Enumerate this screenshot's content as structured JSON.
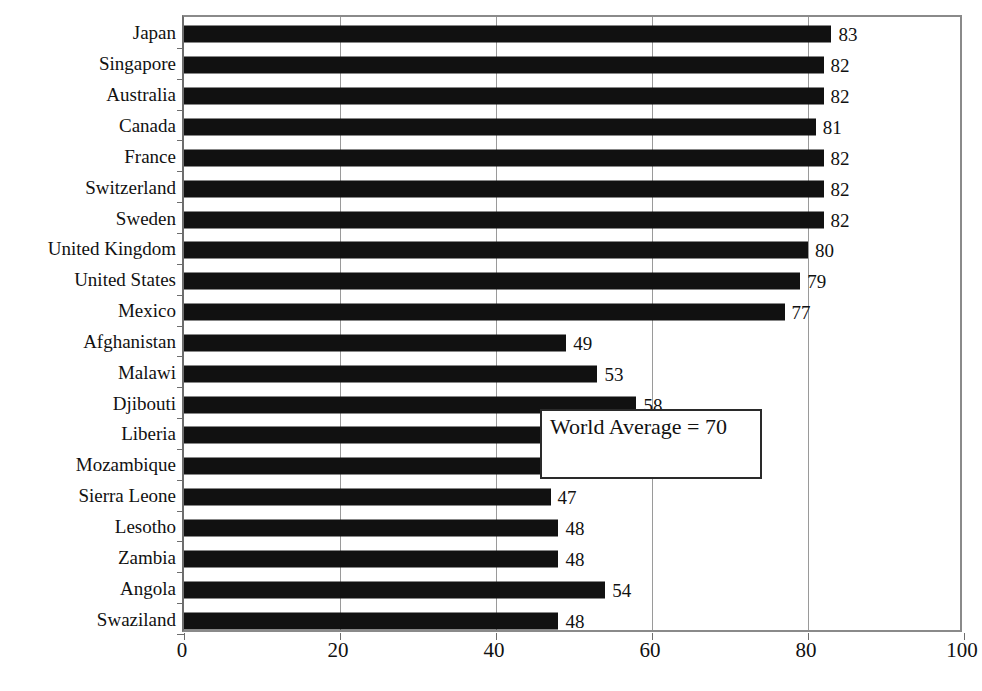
{
  "chart_data": {
    "type": "bar",
    "orientation": "horizontal",
    "title": "",
    "subtitle": "",
    "xlabel": "",
    "ylabel": "",
    "xlim": [
      0,
      100
    ],
    "xticks": [
      0,
      20,
      40,
      60,
      80,
      100
    ],
    "grid": true,
    "legend": null,
    "bar_color": "#111111",
    "categories": [
      "Japan",
      "Singapore",
      "Australia",
      "Canada",
      "France",
      "Switzerland",
      "Sweden",
      "United Kingdom",
      "United States",
      "Mexico",
      "Afghanistan",
      "Malawi",
      "Djibouti",
      "Liberia",
      "Mozambique",
      "Sierra Leone",
      "Lesotho",
      "Zambia",
      "Angola",
      "Swaziland"
    ],
    "values": [
      83,
      82,
      82,
      81,
      82,
      82,
      82,
      80,
      79,
      77,
      49,
      53,
      58,
      56,
      52,
      47,
      48,
      48,
      54,
      48
    ],
    "data_labels": [
      "83",
      "82",
      "82",
      "81",
      "82",
      "82",
      "82",
      "80",
      "79",
      "77",
      "49",
      "53",
      "58",
      "56",
      "52",
      "47",
      "48",
      "48",
      "54",
      "48"
    ],
    "annotations": [
      {
        "text": "World Average = 70",
        "value": 70,
        "boxed": true
      }
    ]
  },
  "axis": {
    "x_tick_labels": [
      "0",
      "20",
      "40",
      "60",
      "80",
      "100"
    ]
  },
  "annotation": {
    "world_average_label": "World Average = 70"
  }
}
